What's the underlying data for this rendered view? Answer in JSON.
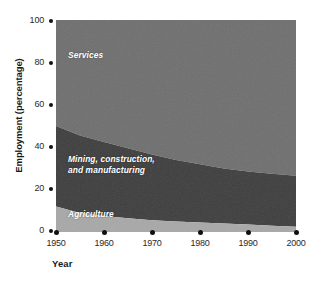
{
  "chart_data": {
    "type": "area",
    "stacked": true,
    "title": "",
    "xlabel": "Year",
    "ylabel": "Employment (percentage)",
    "xlim": [
      1950,
      2000
    ],
    "ylim": [
      0,
      100
    ],
    "grid": false,
    "legend_position": "inside-bands",
    "x": [
      1950,
      1955,
      1960,
      1965,
      1970,
      1975,
      1980,
      1985,
      1990,
      1995,
      2000
    ],
    "xticks": [
      "1950",
      "1960",
      "1970",
      "1980",
      "1990",
      "2000"
    ],
    "yticks": [
      "0",
      "20",
      "40",
      "60",
      "80",
      "100"
    ],
    "series": [
      {
        "name": "Agriculture",
        "color": "#a8a8a8",
        "values": [
          12,
          9,
          7.5,
          6.5,
          5.5,
          5,
          4.5,
          4,
          3.5,
          3,
          2.5
        ]
      },
      {
        "name": "Mining, construction, and manufacturing",
        "color": "#3e3e3e",
        "values": [
          38,
          36.5,
          35,
          33,
          31,
          29,
          27.5,
          26,
          25,
          24.5,
          24
        ]
      },
      {
        "name": "Services",
        "color": "#6f6f6f",
        "values": [
          50,
          54.5,
          57.5,
          60.5,
          63.5,
          66,
          68,
          70,
          71.5,
          72.5,
          73.5
        ]
      }
    ],
    "boundaries": {
      "agriculture_top": [
        12,
        9,
        7.5,
        6.5,
        5.5,
        5,
        4.5,
        4,
        3.5,
        3,
        2.5
      ],
      "manufacturing_top": [
        50,
        45.5,
        42.5,
        39.5,
        36.5,
        34,
        32,
        30,
        28.5,
        27.5,
        26.5
      ]
    }
  },
  "axes": {
    "y_axis_label": "Employment (percentage)",
    "x_axis_label": "Year",
    "y_ticks": [
      {
        "label": "100",
        "value": 100
      },
      {
        "label": "80",
        "value": 80
      },
      {
        "label": "60",
        "value": 60
      },
      {
        "label": "40",
        "value": 40
      },
      {
        "label": "20",
        "value": 20
      },
      {
        "label": "0",
        "value": 0
      }
    ],
    "x_ticks": [
      {
        "label": "1950",
        "value": 1950
      },
      {
        "label": "1960",
        "value": 1960
      },
      {
        "label": "1970",
        "value": 1970
      },
      {
        "label": "1980",
        "value": 1980
      },
      {
        "label": "1990",
        "value": 1990
      },
      {
        "label": "2000",
        "value": 2000
      }
    ]
  },
  "band_labels": {
    "services": "Services",
    "mining": "Mining, construction,\nand manufacturing",
    "agriculture": "Agriculture"
  },
  "colors": {
    "agriculture": "#a8a8a8",
    "manufacturing": "#3e3e3e",
    "services": "#6f6f6f",
    "text": "#1a1a1a",
    "tick_marker": "#111111",
    "background": "#ffffff",
    "band_label_text": "#ffffff"
  }
}
